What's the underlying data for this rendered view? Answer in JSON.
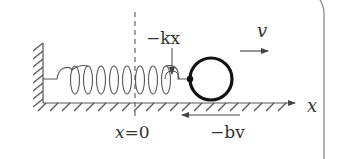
{
  "diagram": {
    "labels": {
      "spring_force": "−kx",
      "velocity": "v",
      "axis": "x",
      "origin_prefix": "x",
      "origin_eq": "=",
      "origin_value": "0",
      "damping_force": "−bv"
    },
    "colors": {
      "stroke": "#444444",
      "ball": "#111111",
      "background": "#ffffff"
    }
  }
}
